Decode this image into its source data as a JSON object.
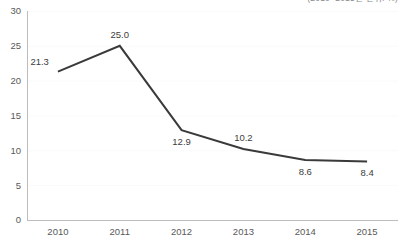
{
  "header": {
    "clipped_title": "(2010~2015년 단위: %)"
  },
  "chart_data": {
    "type": "line",
    "title": "",
    "subtitle": "",
    "xlabel": "",
    "ylabel": "",
    "categories": [
      "2010",
      "2011",
      "2012",
      "2013",
      "2014",
      "2015"
    ],
    "values": [
      21.3,
      25.0,
      12.9,
      10.2,
      8.6,
      8.4
    ],
    "point_labels": [
      "21.3",
      "25.0",
      "12.9",
      "10.2",
      "8.6",
      "8.4"
    ],
    "point_label_positions": [
      "above-left",
      "above",
      "below",
      "above",
      "below",
      "below"
    ],
    "ylim": [
      0,
      30
    ],
    "ytick_values": [
      0,
      5,
      10,
      15,
      20,
      25,
      30
    ],
    "ytick_labels": [
      "0",
      "5",
      "10",
      "15",
      "20",
      "25",
      "30"
    ],
    "grid": true,
    "grid_axis": "y",
    "legend": false,
    "legend_position": "none",
    "markers": false,
    "series": [
      {
        "name": "series-1",
        "values": [
          21.3,
          25.0,
          12.9,
          10.2,
          8.6,
          8.4
        ]
      }
    ]
  },
  "style": {
    "line_color": "#3a3a3a",
    "grid_color": "#fafafa",
    "axis_color": "#bdbdbd",
    "tick_label_color": "#595959",
    "point_label_color": "#3d3d3d",
    "background_color": "#ffffff"
  }
}
